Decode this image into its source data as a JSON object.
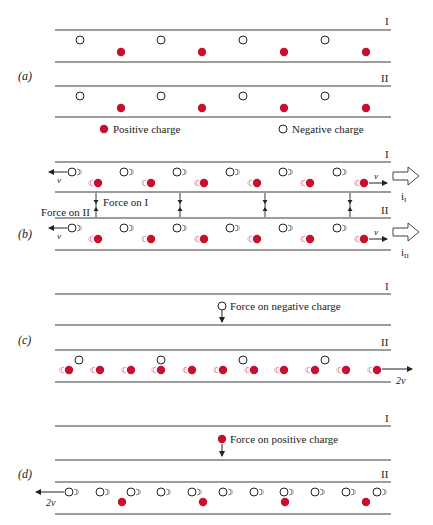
{
  "colors": {
    "positive": "#c8102e",
    "negative_fill": "#ffffff",
    "negative_stroke": "#222222",
    "line": "#3a3a3a",
    "text": "#222222"
  },
  "wire_labels": {
    "one": "I",
    "two": "II"
  },
  "panels": {
    "a": {
      "label": "(a)",
      "legend": {
        "positive": "Positive charge",
        "negative": "Negative charge"
      }
    },
    "b": {
      "label": "(b)",
      "velocity_label": "v",
      "force_on_I": "Force on I",
      "force_on_II": "Force on II",
      "current_I": "I",
      "current_II": "II",
      "current_prefix": "i"
    },
    "c": {
      "label": "(c)",
      "annotation": "Force on negative charge",
      "velocity_label": "2v"
    },
    "d": {
      "label": "(d)",
      "annotation": "Force on positive charge",
      "velocity_label": "2v"
    }
  }
}
